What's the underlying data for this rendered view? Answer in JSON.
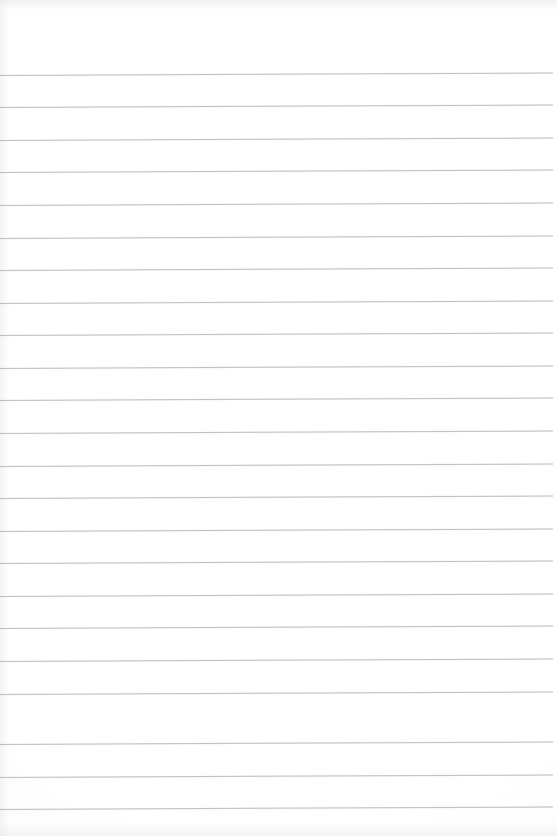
{
  "document": {
    "type": "blank-ruled-notebook-page",
    "title": "",
    "body_text": "",
    "content_note": "no handwriting, no printed text, no marks",
    "page_width_px": 557,
    "page_height_px": 836
  },
  "paper": {
    "background_color": "#fdfdfd",
    "edge_shadow_color": "#e2e4e8"
  },
  "ruling": {
    "line_color": "#b9bcc4",
    "line_thickness_px": 1,
    "line_count": 23,
    "first_line_y_px": 75,
    "line_spacing_px": 32.6,
    "line_left_x_px": 0,
    "line_right_x_px": 553,
    "slant_degrees": -0.26,
    "top_margin_px": 75,
    "bottom_margin_px": 27,
    "lines": [
      {
        "index": 1,
        "y": 75
      },
      {
        "index": 2,
        "y": 107
      },
      {
        "index": 3,
        "y": 140
      },
      {
        "index": 4,
        "y": 172
      },
      {
        "index": 5,
        "y": 205
      },
      {
        "index": 6,
        "y": 238
      },
      {
        "index": 7,
        "y": 270
      },
      {
        "index": 8,
        "y": 303
      },
      {
        "index": 9,
        "y": 335
      },
      {
        "index": 10,
        "y": 368
      },
      {
        "index": 11,
        "y": 400
      },
      {
        "index": 12,
        "y": 433
      },
      {
        "index": 13,
        "y": 466
      },
      {
        "index": 14,
        "y": 498
      },
      {
        "index": 15,
        "y": 531
      },
      {
        "index": 16,
        "y": 563
      },
      {
        "index": 17,
        "y": 596
      },
      {
        "index": 18,
        "y": 628
      },
      {
        "index": 19,
        "y": 661
      },
      {
        "index": 20,
        "y": 694
      },
      {
        "index": 21,
        "y": 744
      },
      {
        "index": 22,
        "y": 777
      },
      {
        "index": 23,
        "y": 809
      }
    ]
  }
}
